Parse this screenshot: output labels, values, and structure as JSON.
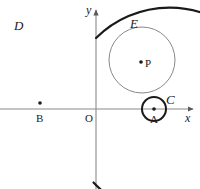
{
  "figure": {
    "background_color": "#ffffff",
    "stroke_color": "#1a1a1a",
    "thin_stroke_color": "#7a7a7a",
    "axis_color": "#8a8a8a"
  },
  "axes": {
    "x_axis": {
      "label": "x",
      "label_x": 185,
      "label_y": 122,
      "y": 109,
      "x_start": 0,
      "x_end": 193,
      "arrow": "right"
    },
    "y_axis": {
      "label": "y",
      "label_x": 86,
      "label_y": 14,
      "x": 96,
      "y_start": 10,
      "y_end": 189,
      "arrow": "up"
    },
    "origin": {
      "label": "O",
      "label_x": 85,
      "label_y": 122
    }
  },
  "curves": {
    "major_arc_D": {
      "label": "D",
      "label_x": 14,
      "label_y": 30,
      "center_x": 20,
      "center_y": 109,
      "radius": 104,
      "stroke_width": 2.2,
      "stroke": "#1a1a1a",
      "start_angle_deg": -43,
      "end_angle_deg": 45,
      "description": "bold major arc open to the left"
    },
    "circle_E": {
      "label": "E",
      "label_x": 130,
      "label_y": 28,
      "center_x": 142,
      "center_y": 60,
      "radius": 33,
      "stroke_width": 0.9,
      "stroke": "#7a7a7a"
    },
    "circle_C": {
      "label": "C",
      "label_x": 166,
      "label_y": 104,
      "center_x": 154,
      "center_y": 109,
      "radius": 12,
      "stroke_width": 2.0,
      "stroke": "#1a1a1a"
    }
  },
  "points": [
    {
      "name": "B",
      "label": "B",
      "x": 40,
      "y": 103,
      "label_x": 36,
      "label_y": 122,
      "dot_radius": 1.8,
      "style": "upright"
    },
    {
      "name": "P",
      "label": "P",
      "x": 141,
      "y": 62,
      "label_x": 145,
      "label_y": 67,
      "dot_radius": 1.8,
      "style": "upright"
    },
    {
      "name": "A",
      "label": "A",
      "x": 154,
      "y": 109,
      "label_x": 150,
      "label_y": 123,
      "dot_radius": 1.8,
      "style": "upright"
    }
  ]
}
